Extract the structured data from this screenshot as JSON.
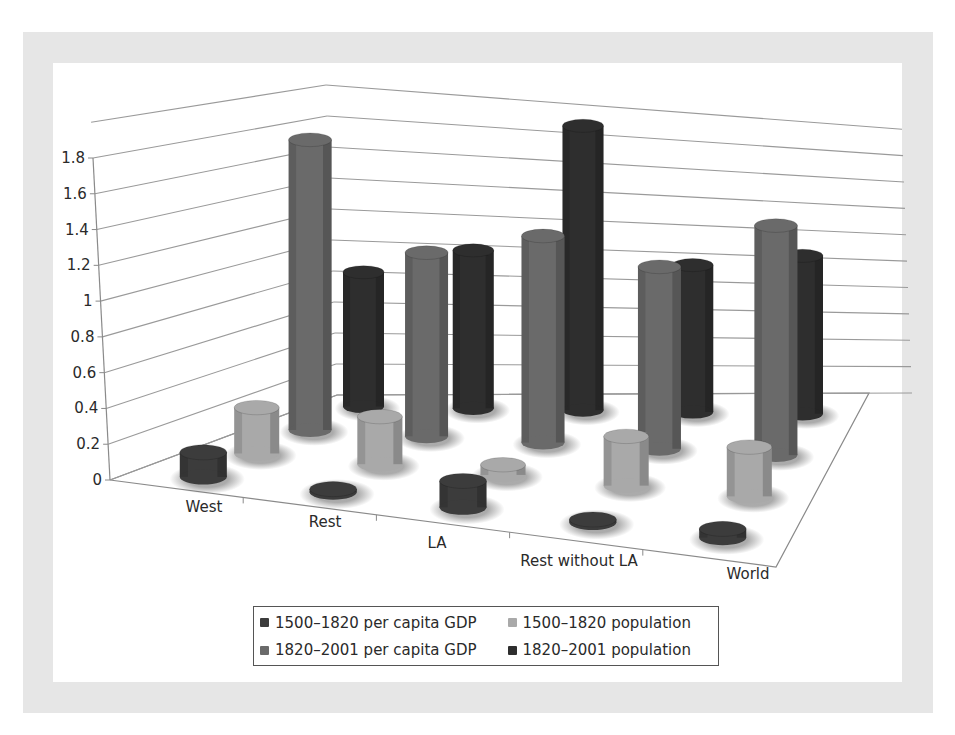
{
  "chart_data": {
    "type": "bar",
    "subtype": "3d-cylinder",
    "title": "",
    "xlabel": "",
    "ylabel": "",
    "categories": [
      "West",
      "Rest",
      "LA",
      "Rest without LA",
      "World"
    ],
    "y_ticks": [
      "0",
      "0.2",
      "0.4",
      "0.6",
      "0.8",
      "1",
      "1.2",
      "1.4",
      "1.6",
      "1.8"
    ],
    "ylim": [
      0,
      2.0
    ],
    "grid": true,
    "legend_position": "bottom",
    "series": [
      {
        "name": "1500–1820 per capita GDP",
        "color": "#3c3c3c",
        "values": [
          0.14,
          0.01,
          0.15,
          0.01,
          0.05
        ]
      },
      {
        "name": "1500–1820 population",
        "color": "#a9a9a9",
        "values": [
          0.27,
          0.28,
          0.06,
          0.29,
          0.29
        ]
      },
      {
        "name": "1820–2001 per capita GDP",
        "color": "#6a6a6a",
        "values": [
          1.77,
          1.12,
          1.26,
          1.11,
          1.4
        ]
      },
      {
        "name": "1820–2001 population",
        "color": "#2e2e2e",
        "values": [
          0.85,
          1.0,
          1.8,
          0.93,
          1.0
        ]
      }
    ]
  },
  "legend": {
    "items": [
      {
        "label": "1500–1820 per capita GDP",
        "color": "#3c3c3c"
      },
      {
        "label": "1500–1820 population",
        "color": "#a9a9a9"
      },
      {
        "label": "1820–2001 per capita GDP",
        "color": "#6a6a6a"
      },
      {
        "label": "1820–2001 population",
        "color": "#2e2e2e"
      }
    ]
  },
  "colors": {
    "frame": "#e6e6e6",
    "panel": "#ffffff",
    "gridline": "#9a9a9a",
    "axis": "#8a8a8a"
  }
}
